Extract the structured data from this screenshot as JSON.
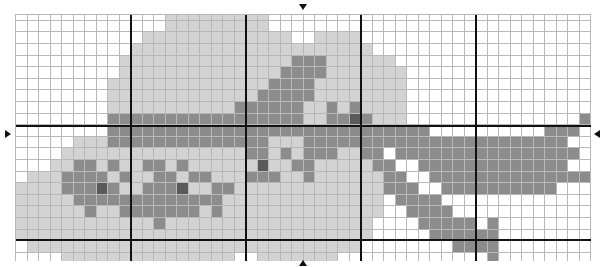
{
  "puzzle": {
    "type": "pixel-grid",
    "columns": 50,
    "rows": 22,
    "cell_width": 11.5,
    "cell_height": 11.6,
    "thick_line_every": 10,
    "palette": {
      "W": "#ffffff",
      "L": "#d3d3d3",
      "M": "#8c8c8c",
      "D": "#5a5a5a"
    },
    "grid": [
      "WWWWWWWWWWWWWLLLLLLLLLWWWWWWWWWWWWWWWWWWWWWWWWWWWW",
      "WWWWWWWWWWWWWLLLLLLLLLWWWWWWWWWWWWWWWWWWWWWWWWWWWW",
      "WWWWWWWWWWWLLLLLLLLLLLLLWWLLLLWWWWWWWWWWWWWWWWWWWW",
      "WWWWWWWWWWLLLLLLLLLLLLLLLLLLLLLWWWWWWWWWWWWWWWWWWW",
      "WWWWWWWWWLLLLLLLLLLLLLLLMMMLLLLLLWWWWWWWWWWWWWWWWWW",
      "WWWWWWWWWLLLLLLLLLLLLLLMMMMLLLLLLLWWWWWWWWWWWWWWWWW",
      "WWWWWWWWLLLLLLLLLLLLLLMMMMLLLLLLLLWWWWWWWWWWWWWWWWW",
      "WWWWWWWWLLLLLLLLLLLLLMMMMMLLLLLLLLWWWWWWWWWWWWWWWWW",
      "WWWWWWWWLLLLLLLLLLLMMMMMMLLMLMLLLLWWWWWWWWWWWWWWWWW",
      "WWWWWWWWMMMMMMMMMMMMMMMMMLLMMDMLLLWWWWWWWWWWWWWWWMW",
      "WWWWWWWWMMMMMMMMMMMMMMMMMMMMMMMMMMMMWWWWWWWWWWMMMWW",
      "WWWWWLLLMMMMMMMMMMMMMMLLLMMMMMMMMMMMMMMMMMMMMMMMWWW",
      "WWWWLLLLLLLLLLLLLLLLMMLMLMMMLLMMWMMMMMMMMMMMMMMMMWWW",
      "WWWLLMMLMLLMMLMLLLLLLDLLMMLLLLLMMWWMMMMMMMMMMMMMWWM",
      "WLLLMMMMLMLLMMLMMLLLMMMLLMLLLLLLMMWWMMMMMMMMMMMMMMMM",
      "LLLLMMMDMLLMMMDLLMMLLLLLLLLLLLLLMMMWWMMMMMMMMMMWWWW",
      "LLLLLMMMMMMMMMMMMMLLLLLLLLLLLLLLWMMMMWWWWWWWWWWWWWWW",
      "LLLLLLMLLMMMMMMMLMLLLLLLLLLLLLLLWWMMMMWWWWWWWWWWWWWW",
      "LLLLLLLLLLLLMLLLLLLLLLLLLLLLLLLWWWWMMMMMWMWWWWWWWWWW",
      "LLLLLLLLLLLLLLLLLLLLLLLLLLLLLLLWWWWWMMMMMMWWWWWWWWWW",
      "WLLLLLLLLLLLLLLLLLLLLLLLLLLLLLWWWWWWWWMMMMWWWWWWWWWW",
      "WWWWLLLLLLLLLLLLLLLWWLLLLLLLWWWWWWWWWWWWWMWWWWWWWWWW"
    ]
  },
  "markers": {
    "top": "down-arrow",
    "bottom": "up-arrow",
    "left": "right-arrow",
    "right": "left-arrow"
  }
}
